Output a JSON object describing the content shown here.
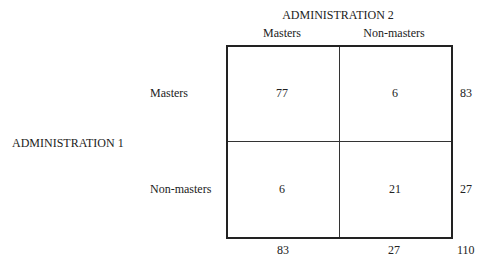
{
  "table": {
    "column_header": "ADMINISTRATION 2",
    "row_header": "ADMINISTRATION 1",
    "columns": [
      "Masters",
      "Non-masters"
    ],
    "rows": [
      {
        "label": "Masters",
        "cells": [
          "77",
          "6"
        ],
        "total": "83"
      },
      {
        "label": "Non-masters",
        "cells": [
          "6",
          "21"
        ],
        "total": "27"
      }
    ],
    "column_totals": [
      "83",
      "27"
    ],
    "grand_total": "110"
  }
}
